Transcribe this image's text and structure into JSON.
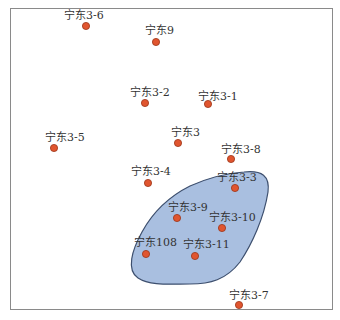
{
  "map": {
    "colors": {
      "frame": "#8a8a8a",
      "zone_fill": "#a9bfe0",
      "zone_stroke": "#3d4f6e",
      "well_fill": "#e0552f",
      "well_stroke": "#9a3417",
      "label": "#333333"
    },
    "zone": {
      "name": "shaded-zone"
    },
    "wells": [
      {
        "name": "宁东3-6",
        "x": 86,
        "y": 26,
        "lx": 64,
        "ly": 10
      },
      {
        "name": "宁东9",
        "x": 156,
        "y": 42,
        "lx": 145,
        "ly": 25
      },
      {
        "name": "宁东3-2",
        "x": 145,
        "y": 103,
        "lx": 130,
        "ly": 87
      },
      {
        "name": "宁东3-1",
        "x": 208,
        "y": 104,
        "lx": 198,
        "ly": 91
      },
      {
        "name": "宁东3-5",
        "x": 54,
        "y": 148,
        "lx": 45,
        "ly": 132
      },
      {
        "name": "宁东3",
        "x": 178,
        "y": 143,
        "lx": 171,
        "ly": 127
      },
      {
        "name": "宁东3-8",
        "x": 231,
        "y": 159,
        "lx": 221,
        "ly": 144
      },
      {
        "name": "宁东3-4",
        "x": 148,
        "y": 183,
        "lx": 131,
        "ly": 166
      },
      {
        "name": "宁东3-3",
        "x": 235,
        "y": 188,
        "lx": 217,
        "ly": 172
      },
      {
        "name": "宁东3-9",
        "x": 177,
        "y": 218,
        "lx": 168,
        "ly": 202
      },
      {
        "name": "宁东3-10",
        "x": 222,
        "y": 228,
        "lx": 209,
        "ly": 212
      },
      {
        "name": "宁东108",
        "x": 146,
        "y": 254,
        "lx": 134,
        "ly": 237
      },
      {
        "name": "宁东3-11",
        "x": 195,
        "y": 256,
        "lx": 183,
        "ly": 239
      },
      {
        "name": "宁东3-7",
        "x": 239,
        "y": 305,
        "lx": 229,
        "ly": 290
      }
    ]
  }
}
